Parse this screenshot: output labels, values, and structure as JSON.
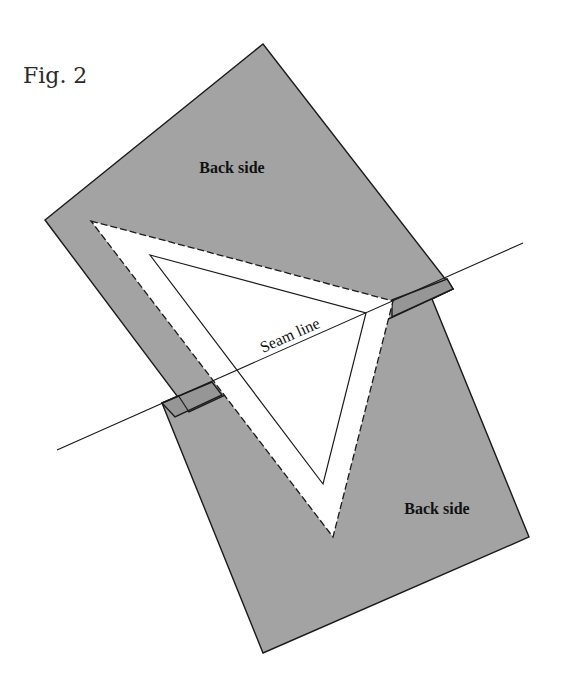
{
  "figure": {
    "title": "Fig. 2",
    "labels": {
      "back_side_top": "Back side",
      "back_side_bottom": "Back side",
      "seam_line": "Seam line"
    },
    "colors": {
      "fabric_back": "#a3a3a3",
      "overlap": "#969696",
      "outline": "#1a1a1a",
      "background": "#ffffff"
    },
    "elements": [
      {
        "name": "upper-fabric-piece",
        "side": "Back side"
      },
      {
        "name": "lower-fabric-piece",
        "side": "Back side"
      },
      {
        "name": "dashed-cut-triangle",
        "style": "dashed"
      },
      {
        "name": "inner-seam-triangle",
        "style": "solid"
      },
      {
        "name": "seam-line",
        "style": "solid"
      }
    ]
  }
}
